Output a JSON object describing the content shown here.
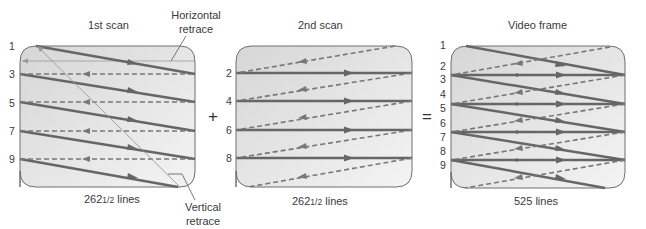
{
  "panels": [
    {
      "id": "first-scan",
      "title": "1st scan",
      "caption_main": "262",
      "caption_frac": "1/2",
      "caption_suffix": " lines",
      "line_labels": [
        "1",
        "3",
        "5",
        "7",
        "9"
      ]
    },
    {
      "id": "second-scan",
      "title": "2nd scan",
      "caption_main": "262",
      "caption_frac": "1/2",
      "caption_suffix": " lines",
      "line_labels": [
        "2",
        "4",
        "6",
        "8"
      ]
    },
    {
      "id": "video-frame",
      "title": "Video frame",
      "caption_main": "525",
      "caption_frac": "",
      "caption_suffix": " lines",
      "line_labels": [
        "1",
        "2",
        "3",
        "4",
        "5",
        "6",
        "7",
        "8",
        "9"
      ]
    }
  ],
  "operators": {
    "plus": "+",
    "equals": "="
  },
  "callouts": {
    "horizontal_retrace": {
      "line1": "Horizontal",
      "line2": "retrace"
    },
    "vertical_retrace": {
      "line1": "Vertical",
      "line2": "retrace"
    }
  },
  "colors": {
    "box_fill_top": "#d9d9d9",
    "box_fill_bottom": "#f2f2f2",
    "box_stroke": "#6e6e6e",
    "scan_line": "#6a6a6a",
    "retrace_line": "#888888"
  }
}
